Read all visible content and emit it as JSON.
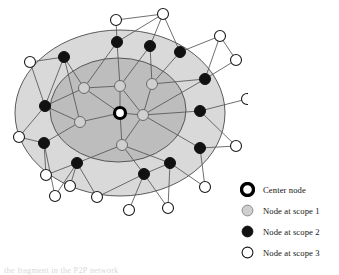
{
  "figure": {
    "caption": "the fragment in the P2P network"
  },
  "colors": {
    "scope1_region_fill": "#d9d9d9",
    "scope2_region_fill": "#bdbdbd",
    "region_stroke": "#4a4a4a",
    "edge": "#555555",
    "center_node_ring": "#000000",
    "center_node_fill": "#ffffff",
    "scope1_node_fill": "#cfcfcf",
    "scope1_node_stroke": "#6b6b6b",
    "scope2_node_fill": "#111111",
    "scope3_node_fill": "#ffffff",
    "scope3_node_stroke": "#1a1a1a",
    "text": "#141414"
  },
  "legend": {
    "items": [
      {
        "icon": "center-node-ring-icon",
        "label": "Center node",
        "swatch": "center"
      },
      {
        "icon": "gray-filled-circle-icon",
        "label": "Node at scope 1",
        "swatch": "scope1"
      },
      {
        "icon": "black-filled-circle-icon",
        "label": "Node at scope 2",
        "swatch": "scope2"
      },
      {
        "icon": "white-filled-circle-icon",
        "label": "Node at scope 3",
        "swatch": "scope3"
      }
    ]
  },
  "chart_data": {
    "type": "diagram",
    "regions": [
      {
        "name": "scope-1-region",
        "label": "Node at scope 1",
        "cx": 120,
        "cy": 113,
        "rx": 105,
        "ry": 83,
        "fill": "#d9d9d9"
      },
      {
        "name": "scope-2-region",
        "label": "Node at scope 2",
        "cx": 118,
        "cy": 110,
        "rx": 68,
        "ry": 52,
        "fill": "#bdbdbd"
      }
    ],
    "nodes": [
      {
        "id": "C",
        "scope": 0,
        "x": 120,
        "y": 113
      },
      {
        "id": "A1",
        "scope": 1,
        "x": 84,
        "y": 88
      },
      {
        "id": "A2",
        "scope": 1,
        "x": 120,
        "y": 86
      },
      {
        "id": "A3",
        "scope": 1,
        "x": 152,
        "y": 84
      },
      {
        "id": "A4",
        "scope": 1,
        "x": 143,
        "y": 115
      },
      {
        "id": "A5",
        "scope": 1,
        "x": 80,
        "y": 122
      },
      {
        "id": "A6",
        "scope": 1,
        "x": 122,
        "y": 145
      },
      {
        "id": "B1",
        "scope": 2,
        "x": 64,
        "y": 57
      },
      {
        "id": "B2",
        "scope": 2,
        "x": 117,
        "y": 42
      },
      {
        "id": "B3",
        "scope": 2,
        "x": 150,
        "y": 46
      },
      {
        "id": "B4",
        "scope": 2,
        "x": 180,
        "y": 52
      },
      {
        "id": "B5",
        "scope": 2,
        "x": 205,
        "y": 79
      },
      {
        "id": "B6",
        "scope": 2,
        "x": 200,
        "y": 111
      },
      {
        "id": "B7",
        "scope": 2,
        "x": 45,
        "y": 106
      },
      {
        "id": "B8",
        "scope": 2,
        "x": 44,
        "y": 143
      },
      {
        "id": "B9",
        "scope": 2,
        "x": 77,
        "y": 163
      },
      {
        "id": "B10",
        "scope": 2,
        "x": 144,
        "y": 174
      },
      {
        "id": "B11",
        "scope": 2,
        "x": 170,
        "y": 163
      },
      {
        "id": "B12",
        "scope": 2,
        "x": 200,
        "y": 148
      },
      {
        "id": "D1",
        "scope": 3,
        "x": 116,
        "y": 20
      },
      {
        "id": "D2",
        "scope": 3,
        "x": 163,
        "y": 14
      },
      {
        "id": "D3",
        "scope": 3,
        "x": 220,
        "y": 36
      },
      {
        "id": "D4",
        "scope": 3,
        "x": 236,
        "y": 60
      },
      {
        "id": "D5",
        "scope": 3,
        "x": 247,
        "y": 99
      },
      {
        "id": "D6",
        "scope": 3,
        "x": 30,
        "y": 62
      },
      {
        "id": "D7",
        "scope": 3,
        "x": 19,
        "y": 137
      },
      {
        "id": "D8",
        "scope": 3,
        "x": 46,
        "y": 175
      },
      {
        "id": "D9",
        "scope": 3,
        "x": 70,
        "y": 186
      },
      {
        "id": "D10",
        "scope": 3,
        "x": 97,
        "y": 197
      },
      {
        "id": "D11",
        "scope": 3,
        "x": 129,
        "y": 210
      },
      {
        "id": "D12",
        "scope": 3,
        "x": 168,
        "y": 208
      },
      {
        "id": "D13",
        "scope": 3,
        "x": 205,
        "y": 187
      },
      {
        "id": "D14",
        "scope": 3,
        "x": 236,
        "y": 146
      },
      {
        "id": "D15",
        "scope": 3,
        "x": 55,
        "y": 196
      }
    ],
    "edges": [
      [
        "C",
        "A1"
      ],
      [
        "C",
        "A2"
      ],
      [
        "C",
        "A4"
      ],
      [
        "C",
        "A5"
      ],
      [
        "C",
        "A6"
      ],
      [
        "A4",
        "A2"
      ],
      [
        "A4",
        "A3"
      ],
      [
        "A4",
        "A6"
      ],
      [
        "A4",
        "B6"
      ],
      [
        "A4",
        "B12"
      ],
      [
        "A4",
        "B5"
      ],
      [
        "A1",
        "A2"
      ],
      [
        "A1",
        "B1"
      ],
      [
        "A1",
        "B7"
      ],
      [
        "A1",
        "B2"
      ],
      [
        "A2",
        "B2"
      ],
      [
        "A2",
        "B3"
      ],
      [
        "A3",
        "B3"
      ],
      [
        "A3",
        "B4"
      ],
      [
        "A3",
        "B5"
      ],
      [
        "A5",
        "B7"
      ],
      [
        "A5",
        "B8"
      ],
      [
        "A5",
        "B1"
      ],
      [
        "A6",
        "B9"
      ],
      [
        "A6",
        "B10"
      ],
      [
        "A6",
        "B11"
      ],
      [
        "B1",
        "D6"
      ],
      [
        "B1",
        "B7"
      ],
      [
        "B2",
        "D1"
      ],
      [
        "B2",
        "D2"
      ],
      [
        "B3",
        "D2"
      ],
      [
        "B4",
        "D2"
      ],
      [
        "B4",
        "D3"
      ],
      [
        "B5",
        "D3"
      ],
      [
        "B5",
        "D4"
      ],
      [
        "B6",
        "D5"
      ],
      [
        "B6",
        "D14"
      ],
      [
        "B7",
        "D6"
      ],
      [
        "B7",
        "D7"
      ],
      [
        "B8",
        "D7"
      ],
      [
        "B8",
        "D8"
      ],
      [
        "B8",
        "D15"
      ],
      [
        "B9",
        "D9"
      ],
      [
        "B9",
        "D10"
      ],
      [
        "B9",
        "D15"
      ],
      [
        "B10",
        "D10"
      ],
      [
        "B10",
        "D11"
      ],
      [
        "B10",
        "D12"
      ],
      [
        "B11",
        "D12"
      ],
      [
        "B11",
        "D13"
      ],
      [
        "B12",
        "D13"
      ],
      [
        "B12",
        "D14"
      ],
      [
        "D1",
        "D2"
      ],
      [
        "D3",
        "D4"
      ],
      [
        "B9",
        "D8"
      ],
      [
        "B10",
        "B11"
      ]
    ],
    "node_radius": {
      "center": 5.5,
      "scope1": 5.5,
      "scope2": 5.5,
      "scope3": 5.5
    }
  }
}
